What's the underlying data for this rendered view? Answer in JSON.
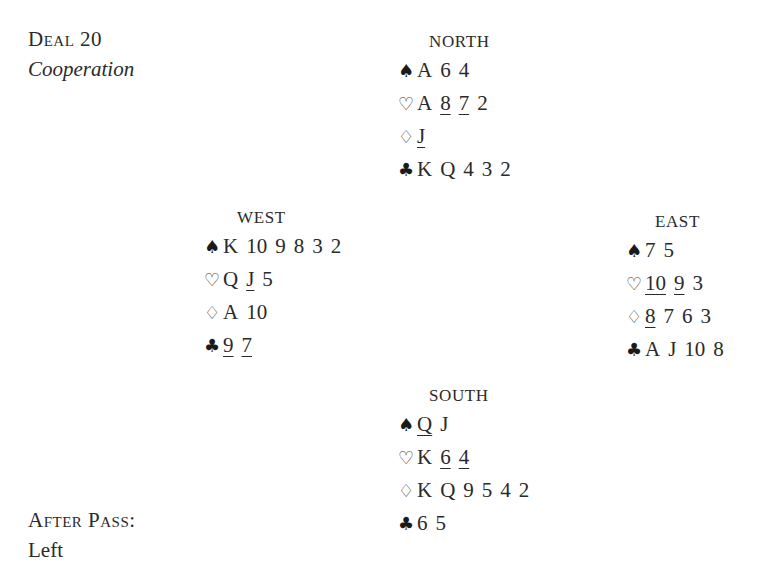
{
  "header": {
    "deal_label": "Deal 20",
    "deal_subtitle": "Cooperation"
  },
  "footer": {
    "pass_label": "After Pass:",
    "pass_direction": "Left",
    "truncated_text": "Whe..."
  },
  "hands": {
    "north": {
      "label": "NORTH",
      "spades": [
        {
          "c": "A",
          "u": false
        },
        {
          "c": "6",
          "u": false
        },
        {
          "c": "4",
          "u": false
        }
      ],
      "hearts": [
        {
          "c": "A",
          "u": false
        },
        {
          "c": "8",
          "u": true
        },
        {
          "c": "7",
          "u": true
        },
        {
          "c": "2",
          "u": false
        }
      ],
      "diamonds": [
        {
          "c": "J",
          "u": true
        }
      ],
      "clubs": [
        {
          "c": "K",
          "u": false
        },
        {
          "c": "Q",
          "u": false
        },
        {
          "c": "4",
          "u": false
        },
        {
          "c": "3",
          "u": false
        },
        {
          "c": "2",
          "u": false
        }
      ]
    },
    "west": {
      "label": "WEST",
      "spades": [
        {
          "c": "K",
          "u": false
        },
        {
          "c": "10",
          "u": false
        },
        {
          "c": "9",
          "u": false
        },
        {
          "c": "8",
          "u": false
        },
        {
          "c": "3",
          "u": false
        },
        {
          "c": "2",
          "u": false
        }
      ],
      "hearts": [
        {
          "c": "Q",
          "u": false
        },
        {
          "c": "J",
          "u": true
        },
        {
          "c": "5",
          "u": false
        }
      ],
      "diamonds": [
        {
          "c": "A",
          "u": false
        },
        {
          "c": "10",
          "u": false
        }
      ],
      "clubs": [
        {
          "c": "9",
          "u": true
        },
        {
          "c": "7",
          "u": true
        }
      ]
    },
    "east": {
      "label": "EAST",
      "spades": [
        {
          "c": "7",
          "u": false
        },
        {
          "c": "5",
          "u": false
        }
      ],
      "hearts": [
        {
          "c": "10",
          "u": true
        },
        {
          "c": "9",
          "u": true
        },
        {
          "c": "3",
          "u": false
        }
      ],
      "diamonds": [
        {
          "c": "8",
          "u": true
        },
        {
          "c": "7",
          "u": false
        },
        {
          "c": "6",
          "u": false
        },
        {
          "c": "3",
          "u": false
        }
      ],
      "clubs": [
        {
          "c": "A",
          "u": false
        },
        {
          "c": "J",
          "u": false
        },
        {
          "c": "10",
          "u": false
        },
        {
          "c": "8",
          "u": false
        }
      ]
    },
    "south": {
      "label": "SOUTH",
      "spades": [
        {
          "c": "Q",
          "u": true
        },
        {
          "c": "J",
          "u": false
        }
      ],
      "hearts": [
        {
          "c": "K",
          "u": false
        },
        {
          "c": "6",
          "u": true
        },
        {
          "c": "4",
          "u": true
        }
      ],
      "diamonds": [
        {
          "c": "K",
          "u": false
        },
        {
          "c": "Q",
          "u": false
        },
        {
          "c": "9",
          "u": false
        },
        {
          "c": "5",
          "u": false
        },
        {
          "c": "4",
          "u": false
        },
        {
          "c": "2",
          "u": false
        }
      ],
      "clubs": [
        {
          "c": "6",
          "u": false
        },
        {
          "c": "5",
          "u": false
        }
      ]
    }
  },
  "suits": {
    "spades": {
      "icon": "spade-icon",
      "glyph": "♠",
      "cls": "black"
    },
    "hearts": {
      "icon": "heart-outline-icon",
      "glyph": "♡",
      "cls": "open"
    },
    "diamonds": {
      "icon": "diamond-outline-icon",
      "glyph": "♢",
      "cls": "open"
    },
    "clubs": {
      "icon": "club-icon",
      "glyph": "♣",
      "cls": "black"
    }
  }
}
